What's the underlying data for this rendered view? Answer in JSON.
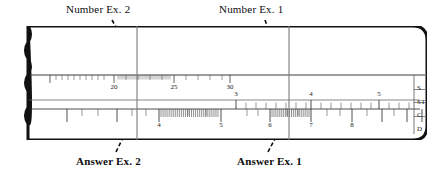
{
  "figure": {
    "type": "slide-rule-diagram"
  },
  "annotations": {
    "top": [
      {
        "id": "number-ex2",
        "text": "Number Ex. 2",
        "target_x": 137,
        "arrow_from_x": 112,
        "arrow_from_y": 20,
        "arrow_to_x": 134,
        "arrow_to_y": 59
      },
      {
        "id": "number-ex1",
        "text": "Number Ex. 1",
        "target_x": 289,
        "arrow_from_x": 265,
        "arrow_from_y": 20,
        "arrow_to_x": 286,
        "arrow_to_y": 80
      }
    ],
    "bottom": [
      {
        "id": "answer-ex2",
        "text": "Answer Ex. 2",
        "target_x": 137,
        "arrow_from_x": 116,
        "arrow_from_y": 152,
        "arrow_to_x": 133,
        "arrow_to_y": 117
      },
      {
        "id": "answer-ex1",
        "text": "Answer Ex. 1",
        "target_x": 289,
        "arrow_from_x": 268,
        "arrow_from_y": 152,
        "arrow_to_x": 287,
        "arrow_to_y": 116
      }
    ]
  },
  "cursors": [
    {
      "id": "cursor-ex2",
      "x": 137,
      "label": "Ex. 2 hairline"
    },
    {
      "id": "cursor-ex1",
      "x": 289,
      "label": "Ex. 1 hairline"
    }
  ],
  "scales": [
    {
      "name": "S",
      "row": 0,
      "axis_y": 49,
      "tick_dir": "down",
      "labels": [
        {
          "text": "20",
          "x": 92
        },
        {
          "text": "25",
          "x": 152
        },
        {
          "text": "30",
          "x": 208
        }
      ],
      "major_ticks_x": [
        28,
        92,
        152,
        208
      ],
      "minor_ticks_x": [
        40,
        52,
        64,
        76,
        104,
        116,
        128,
        140,
        164,
        176,
        188,
        200
      ],
      "fine_ticks_start": 96,
      "fine_ticks_end": 148,
      "fine_ticks_count": 26
    },
    {
      "name": "ST",
      "row": 1,
      "axis_y": 74,
      "tick_dir": "up",
      "labels": [
        {
          "text": "3",
          "x": 214
        },
        {
          "text": "4",
          "x": 289
        },
        {
          "text": "5",
          "x": 357
        }
      ],
      "major_ticks_x": [
        214,
        289,
        357
      ],
      "minor_ticks_x": [
        224,
        234,
        244,
        254,
        264,
        274,
        284,
        299,
        309,
        319,
        329,
        339,
        349,
        367,
        377,
        387
      ]
    },
    {
      "name": "C",
      "row": 2,
      "axis_y": 83,
      "tick_dir": "down",
      "labels": [],
      "major_ticks_x": [],
      "minor_ticks_x": []
    },
    {
      "name": "D",
      "row": 3,
      "axis_y": 83,
      "tick_dir": "both",
      "labels": [
        {
          "text": "4",
          "x": 137
        },
        {
          "text": "5",
          "x": 199
        },
        {
          "text": "6",
          "x": 248
        },
        {
          "text": "7",
          "x": 289
        },
        {
          "text": "8",
          "x": 330
        }
      ],
      "major_ticks_x": [
        45,
        95,
        137,
        199,
        248,
        289,
        330,
        360,
        385,
        400
      ],
      "fine_groups": [
        {
          "start": 139,
          "end": 196,
          "count": 28
        },
        {
          "start": 250,
          "end": 287,
          "count": 19
        }
      ]
    }
  ],
  "scale_names": [
    {
      "text": "S",
      "y": 63
    },
    {
      "text": "ST",
      "y": 77
    },
    {
      "text": "C",
      "y": 90
    },
    {
      "text": "D",
      "y": 104
    }
  ],
  "colors": {
    "frame": "#111111",
    "line": "#4a4a4a",
    "hairline": "#7a7a7a",
    "text": "#0d0d0d",
    "paper": "#ffffff"
  }
}
